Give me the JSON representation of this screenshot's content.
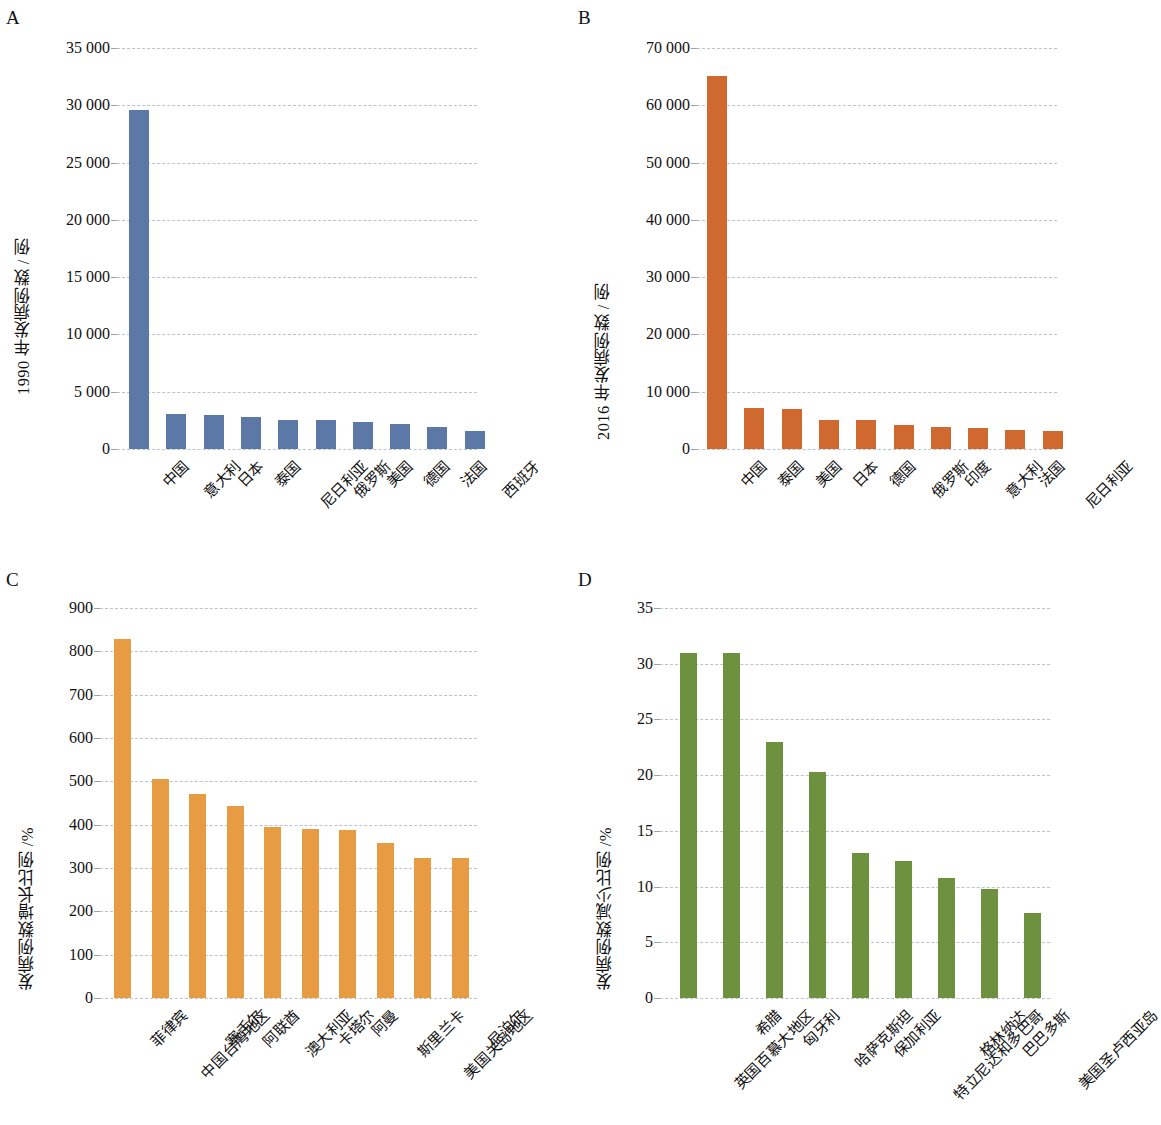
{
  "figure": {
    "panels": [
      "A",
      "B",
      "C",
      "D"
    ],
    "colors": {
      "panel_a_bar": "#5b78a6",
      "panel_b_bar": "#d0692f",
      "panel_c_bar": "#e79b43",
      "panel_d_bar": "#6e9140",
      "gridline": "#b9c2cf",
      "text": "#111111"
    }
  },
  "chart_data": [
    {
      "panel": "A",
      "type": "bar",
      "title": "",
      "xlabel": "",
      "ylabel": "1990 年发病例数 / 例",
      "ylim": [
        0,
        35000
      ],
      "yticks": [
        0,
        5000,
        10000,
        15000,
        20000,
        25000,
        30000,
        35000
      ],
      "ytick_labels": [
        "0",
        "5 000",
        "10 000",
        "15 000",
        "20 000",
        "25 000",
        "30 000",
        "35 000"
      ],
      "grid": true,
      "legend": "none",
      "bar_color": "#5b78a6",
      "categories": [
        "中国",
        "意大利",
        "日本",
        "泰国",
        "尼日利亚",
        "俄罗斯",
        "美国",
        "德国",
        "法国",
        "西班牙"
      ],
      "values": [
        29600,
        3050,
        3000,
        2800,
        2550,
        2520,
        2350,
        2150,
        1900,
        1550
      ]
    },
    {
      "panel": "B",
      "type": "bar",
      "title": "",
      "xlabel": "",
      "ylabel": "2016 年发病例数 / 例",
      "ylim": [
        0,
        70000
      ],
      "yticks": [
        0,
        10000,
        20000,
        30000,
        40000,
        50000,
        60000,
        70000
      ],
      "ytick_labels": [
        "0",
        "10 000",
        "20 000",
        "30 000",
        "40 000",
        "50 000",
        "60 000",
        "70 000"
      ],
      "grid": true,
      "legend": "none",
      "bar_color": "#d0692f",
      "categories": [
        "中国",
        "泰国",
        "美国",
        "日本",
        "德国",
        "俄罗斯",
        "印度",
        "意大利",
        "法国",
        "尼日利亚"
      ],
      "values": [
        65200,
        7200,
        6900,
        5050,
        5000,
        4200,
        3850,
        3700,
        3300,
        3100
      ]
    },
    {
      "panel": "C",
      "type": "bar",
      "title": "",
      "xlabel": "",
      "ylabel": "发病例数增长比例 /%",
      "ylim": [
        0,
        900
      ],
      "yticks": [
        0,
        100,
        200,
        300,
        400,
        500,
        600,
        700,
        800,
        900
      ],
      "ytick_labels": [
        "0",
        "100",
        "200",
        "300",
        "400",
        "500",
        "600",
        "700",
        "800",
        "900"
      ],
      "grid": true,
      "legend": "none",
      "bar_color": "#e79b43",
      "categories": [
        "菲律宾",
        "中国台湾地区",
        "塞舌尔",
        "阿联酋",
        "澳大利亚",
        "卡塔尔",
        "阿曼",
        "斯里兰卡",
        "美国关岛地区",
        "尼泊尔"
      ],
      "values": [
        828,
        505,
        470,
        442,
        395,
        390,
        387,
        357,
        322,
        322
      ]
    },
    {
      "panel": "D",
      "type": "bar",
      "title": "",
      "xlabel": "",
      "ylabel": "发病例数减少比例 /%",
      "ylim": [
        0,
        35
      ],
      "yticks": [
        0,
        5,
        10,
        15,
        20,
        25,
        30,
        35
      ],
      "ytick_labels": [
        "0",
        "5",
        "10",
        "15",
        "20",
        "25",
        "30",
        "35"
      ],
      "grid": true,
      "legend": "none",
      "bar_color": "#6e9140",
      "categories": [
        "英国百慕大地区",
        "希腊",
        "匈牙利",
        "哈萨克斯坦",
        "保加利亚",
        "特立尼达和多巴哥",
        "格林纳达",
        "巴巴多斯",
        "美国圣卢西亚岛"
      ],
      "values": [
        31,
        31,
        23,
        20.3,
        13,
        12.3,
        10.8,
        9.8,
        7.6
      ]
    }
  ]
}
